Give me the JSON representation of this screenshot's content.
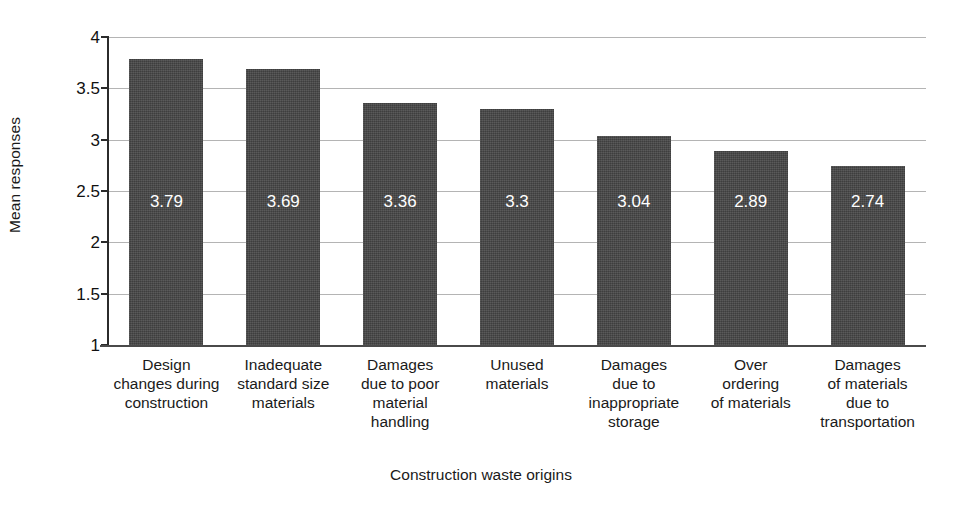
{
  "chart_data": {
    "type": "bar",
    "title": "",
    "xlabel": "Construction waste origins",
    "ylabel": "Mean responses",
    "categories": [
      "Design changes during construction",
      "Inadequate standard size materials",
      "Damages due to poor material handling",
      "Unused materials",
      "Damages due to inappropriate storage",
      "Over ordering of materials",
      "Damages of materials due to transportation"
    ],
    "category_lines": [
      [
        "Design",
        "changes during",
        "construction"
      ],
      [
        "Inadequate",
        "standard size",
        "materials"
      ],
      [
        "Damages",
        "due to poor",
        "material",
        "handling"
      ],
      [
        "Unused",
        "materials"
      ],
      [
        "Damages",
        "due to",
        "inappropriate",
        "storage"
      ],
      [
        "Over",
        "ordering",
        "of materials"
      ],
      [
        "Damages",
        "of materials",
        "due to",
        "transportation"
      ]
    ],
    "values": [
      3.79,
      3.69,
      3.36,
      3.3,
      3.04,
      2.89,
      2.74
    ],
    "value_labels": [
      "3.79",
      "3.69",
      "3.36",
      "3.3",
      "3.04",
      "2.89",
      "2.74"
    ],
    "ylim": [
      1,
      4
    ],
    "yticks": [
      4,
      3.5,
      3,
      2.5,
      2,
      1.5,
      1
    ],
    "ytick_labels": [
      "4",
      "3.5",
      "3",
      "2.5",
      "2",
      "1.5",
      "1"
    ],
    "grid": true,
    "legend": "none",
    "bar_color": "#474747",
    "value_label_color": "#ffffff",
    "gridline_color": "#b4b4b4",
    "axis_color": "#2b2b2b"
  }
}
